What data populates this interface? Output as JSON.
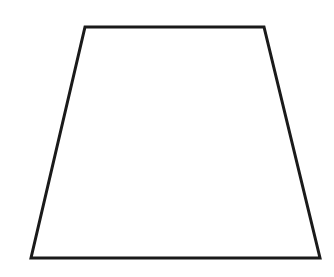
{
  "canvas": {
    "width": 334,
    "height": 277,
    "background_color": "#ffffff",
    "title": "Trapezoid Figure"
  },
  "figure": {
    "name": "trapezoid",
    "shape_type": "quadrilateral",
    "stroke_color": "#1a1a1a",
    "fill_color": "#ffffff",
    "stroke_width": 3,
    "closed": true,
    "points_attr": "85,27 264,27 320,258 31,258",
    "vertices": [
      {
        "label": "top-left",
        "x": 85,
        "y": 27
      },
      {
        "label": "top-right",
        "x": 264,
        "y": 27
      },
      {
        "label": "bottom-right",
        "x": 320,
        "y": 258
      },
      {
        "label": "bottom-left",
        "x": 31,
        "y": 258
      }
    ],
    "edges": [
      {
        "name": "top-edge",
        "from": "top-left",
        "to": "top-right",
        "length_px": 179
      },
      {
        "name": "right-edge",
        "from": "top-right",
        "to": "bottom-right",
        "length_px": 238
      },
      {
        "name": "bottom-edge",
        "from": "bottom-right",
        "to": "bottom-left",
        "length_px": 289
      },
      {
        "name": "left-edge",
        "from": "bottom-left",
        "to": "top-left",
        "length_px": 237
      }
    ]
  },
  "labels": {
    "visible_text": []
  }
}
